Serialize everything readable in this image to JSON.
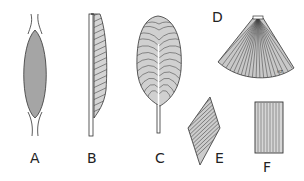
{
  "figure": {
    "panels": [
      {
        "id": "A",
        "label": "A",
        "shape": "fusiform"
      },
      {
        "id": "B",
        "label": "B",
        "shape": "unipennate"
      },
      {
        "id": "C",
        "label": "C",
        "shape": "bipennate"
      },
      {
        "id": "D",
        "label": "D",
        "shape": "triangular"
      },
      {
        "id": "E",
        "label": "E",
        "shape": "rhomboidal"
      },
      {
        "id": "F",
        "label": "F",
        "shape": "quadrate"
      }
    ],
    "signature": "HZ",
    "colors": {
      "ink": "#2a2a2a",
      "paper": "#ffffff"
    }
  }
}
